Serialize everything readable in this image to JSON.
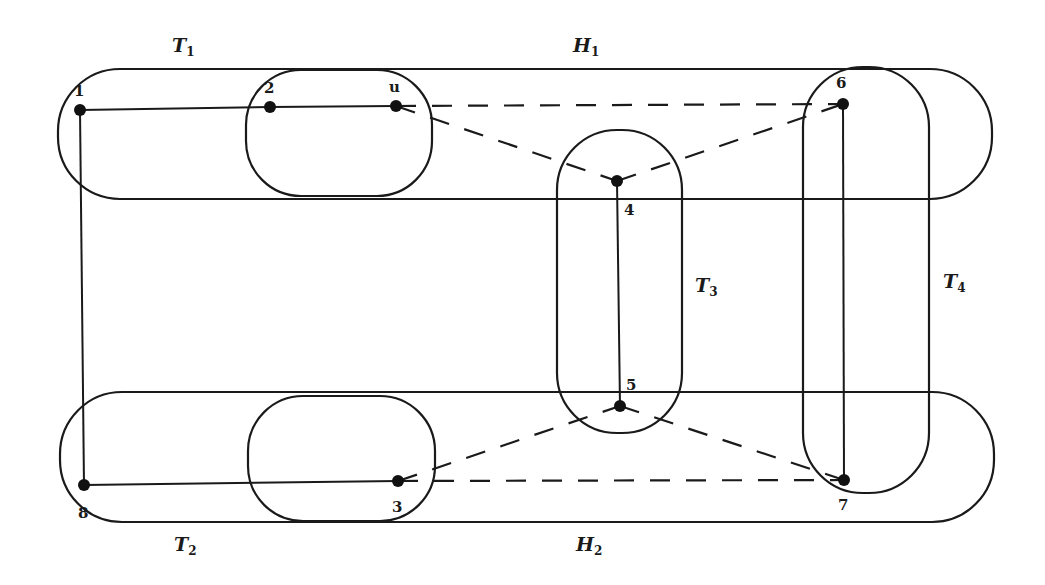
{
  "diagram": {
    "type": "hypergraph",
    "stroke_color": "#1a1a1a",
    "background": "#ffffff",
    "set_labels": {
      "T1": {
        "base": "T",
        "sub": "1"
      },
      "T2": {
        "base": "T",
        "sub": "2"
      },
      "T3": {
        "base": "T",
        "sub": "3"
      },
      "T4": {
        "base": "T",
        "sub": "4"
      },
      "H1": {
        "base": "H",
        "sub": "1"
      },
      "H2": {
        "base": "H",
        "sub": "2"
      }
    },
    "nodes": [
      {
        "id": "1",
        "label": "1"
      },
      {
        "id": "2",
        "label": "2"
      },
      {
        "id": "u",
        "label": "u"
      },
      {
        "id": "4",
        "label": "4"
      },
      {
        "id": "5",
        "label": "5"
      },
      {
        "id": "6",
        "label": "6"
      },
      {
        "id": "7",
        "label": "7"
      },
      {
        "id": "3",
        "label": "3"
      },
      {
        "id": "8",
        "label": "8"
      }
    ],
    "solid_edges": [
      [
        "1",
        "2"
      ],
      [
        "2",
        "u"
      ],
      [
        "1",
        "8"
      ],
      [
        "8",
        "3"
      ],
      [
        "4",
        "5"
      ],
      [
        "6",
        "7"
      ]
    ],
    "dashed_edges": [
      [
        "u",
        "6"
      ],
      [
        "u",
        "4"
      ],
      [
        "4",
        "6"
      ],
      [
        "3",
        "7"
      ],
      [
        "3",
        "5"
      ],
      [
        "5",
        "7"
      ]
    ],
    "regions": [
      {
        "id": "H1",
        "contains": [
          "1",
          "2",
          "u",
          "4",
          "6"
        ]
      },
      {
        "id": "H2",
        "contains": [
          "8",
          "3",
          "5",
          "7"
        ]
      },
      {
        "id": "T1-inner",
        "contains": [
          "2",
          "u"
        ]
      },
      {
        "id": "T2-inner",
        "contains": [
          "3"
        ]
      },
      {
        "id": "T3",
        "contains": [
          "4",
          "5"
        ]
      },
      {
        "id": "T4",
        "contains": [
          "6",
          "7"
        ]
      }
    ]
  }
}
